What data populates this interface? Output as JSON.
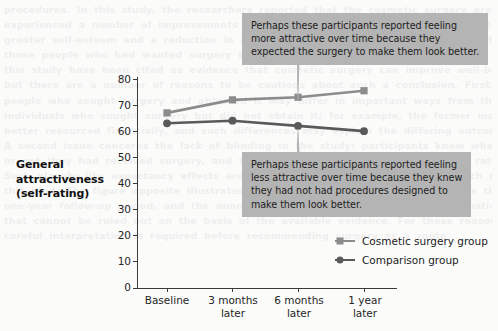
{
  "chart_data": {
    "type": "line",
    "title": "",
    "xlabel": "",
    "ylabel": "General attractiveness (self-rating)",
    "ylim": [
      0,
      80
    ],
    "yticks": [
      80,
      70,
      60,
      50,
      40,
      30,
      20,
      10,
      0
    ],
    "grid": false,
    "legend_position": "inside-bottom-right",
    "categories": [
      "Baseline",
      "3 months later",
      "6 months later",
      "1 year later"
    ],
    "series": [
      {
        "name": "Cosmetic surgery group",
        "marker": "square",
        "color": "#8c8c8c",
        "values": [
          67,
          72,
          73,
          75.5
        ]
      },
      {
        "name": "Comparison group",
        "marker": "circle",
        "color": "#5a5a5a",
        "values": [
          63,
          64,
          62,
          60
        ]
      }
    ],
    "annotations": [
      {
        "id": "callout-surgery",
        "target_series": "Cosmetic surgery group",
        "target_category": "6 months later",
        "lines": [
          "Perhaps these participants reported feeling",
          "more attractive over time because they",
          "expected the surgery to make them look better."
        ]
      },
      {
        "id": "callout-comparison",
        "target_series": "Comparison group",
        "target_category": "6 months later",
        "lines": [
          "Perhaps these participants reported feeling",
          "less attractive over time because they knew",
          "they had not had procedures designed to",
          "make them look better."
        ]
      }
    ]
  },
  "axis": {
    "y_title_lines": [
      "General",
      "attractiveness",
      "(self-rating)"
    ],
    "tick_labels_y": [
      "80",
      "70",
      "60",
      "50",
      "40",
      "30",
      "20",
      "10",
      "0"
    ],
    "tick_labels_x": [
      "Baseline",
      "3 months\nlater",
      "6 months\nlater",
      "1 year\nlater"
    ]
  },
  "legend": {
    "items": [
      {
        "label": "Cosmetic surgery group",
        "marker": "square"
      },
      {
        "label": "Comparison group",
        "marker": "circle"
      }
    ]
  },
  "colors": {
    "surgery": "#8c8c8c",
    "comparison": "#5a5a5a",
    "callout_bg": "#b4b4b4",
    "axis": "#3b3b3b",
    "page_bg": "#fbfbfa"
  },
  "background_text": {
    "lines": [
      "procedures. In this study, the researchers reported that the cosmetic surgery group",
      "experienced a number of improvements in the months after their operations, including",
      "greater self-esteem and a reduction in anxiety. These benefits were not observed in",
      "those people who had wanted surgery but who had not received it. The findings of",
      "this study have been cited as evidence that cosmetic surgery can improve well-being,",
      "but there are a number of reasons to be cautious about such a conclusion. First,",
      "people who sought surgery and obtained it may differ in important ways from those",
      "individuals who sought surgery but did not obtain it; for example, the former may be",
      "better resourced financially, and such differences may explain the differing outcomes.",
      "A second issue concerns the lack of blinding in the study: participants knew whether",
      "",
      "or not they had received surgery, and this knowledge may have shaped their ratings.",
      "Such placebo-like expectancy effects are a well-documented problem in research of",
      "this kind. The figure opposite illustrates the pattern of results obtained across the",
      "one-year follow-up period, and the annotations highlight the alternative explanations",
      "that cannot be ruled out on the basis of the available evidence. For these reasons,",
      "",
      "",
      "",
      "",
      "",
      "careful interpretation is required before recommending surgery as a route"
    ]
  }
}
